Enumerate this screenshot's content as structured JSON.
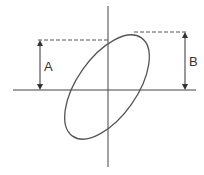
{
  "diagram": {
    "type": "lissajous-ellipse",
    "labels": {
      "a": "A",
      "b": "B"
    },
    "colors": {
      "stroke": "#444444",
      "ellipse": "#555555",
      "dashed": "#555555"
    }
  }
}
